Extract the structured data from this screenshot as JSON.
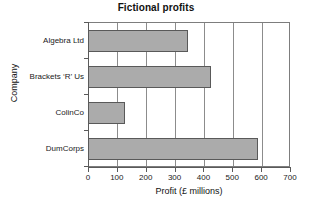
{
  "chart_data": {
    "type": "bar",
    "orientation": "horizontal",
    "title": "Fictional profits",
    "xlabel": "Profit (£ millions)",
    "ylabel": "Company",
    "categories": [
      "Algebra Ltd",
      "Brackets ‘R’ Us",
      "ColinCo",
      "DumCorps"
    ],
    "values": [
      345,
      425,
      128,
      590
    ],
    "xlim": [
      0,
      700
    ],
    "xticks": [
      0,
      100,
      200,
      300,
      400,
      500,
      600,
      700
    ],
    "xtick_labels": [
      "0",
      "100",
      "200",
      "300",
      "400",
      "500",
      "600",
      "700"
    ],
    "grid": "vertical",
    "legend": null,
    "bar_color": "#ababab",
    "bar_edge_color": "#595959",
    "axis_color": "#5a5a5a",
    "background": "#ffffff"
  }
}
